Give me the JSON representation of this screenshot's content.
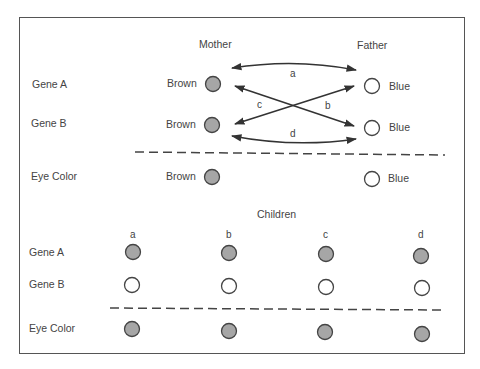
{
  "parents": {
    "mother_label": "Mother",
    "father_label": "Father",
    "row_labels": [
      "Gene A",
      "Gene B",
      "Eye Color"
    ],
    "mother": {
      "gene_a": "Brown",
      "gene_b": "Brown",
      "eye_color": "Brown"
    },
    "father": {
      "gene_a": "Blue",
      "gene_b": "Blue",
      "eye_color": "Blue"
    },
    "crosses": [
      {
        "label": "a",
        "from": "Mother Gene A",
        "to": "Father Gene A"
      },
      {
        "label": "b",
        "from": "Mother Gene A",
        "to": "Father Gene B"
      },
      {
        "label": "c",
        "from": "Mother Gene B",
        "to": "Father Gene A"
      },
      {
        "label": "d",
        "from": "Mother Gene B",
        "to": "Father Gene B"
      }
    ]
  },
  "children": {
    "title": "Children",
    "row_labels": [
      "Gene A",
      "Gene B",
      "Eye Color"
    ],
    "columns": [
      {
        "label": "a",
        "gene_a": "brown",
        "gene_b": "blue",
        "eye_color": "brown"
      },
      {
        "label": "b",
        "gene_a": "brown",
        "gene_b": "blue",
        "eye_color": "brown"
      },
      {
        "label": "c",
        "gene_a": "brown",
        "gene_b": "blue",
        "eye_color": "brown"
      },
      {
        "label": "d",
        "gene_a": "brown",
        "gene_b": "blue",
        "eye_color": "brown"
      }
    ]
  },
  "colors": {
    "brown_fill": "#a6a6a6",
    "blue_fill": "#ffffff",
    "stroke": "#444444"
  }
}
